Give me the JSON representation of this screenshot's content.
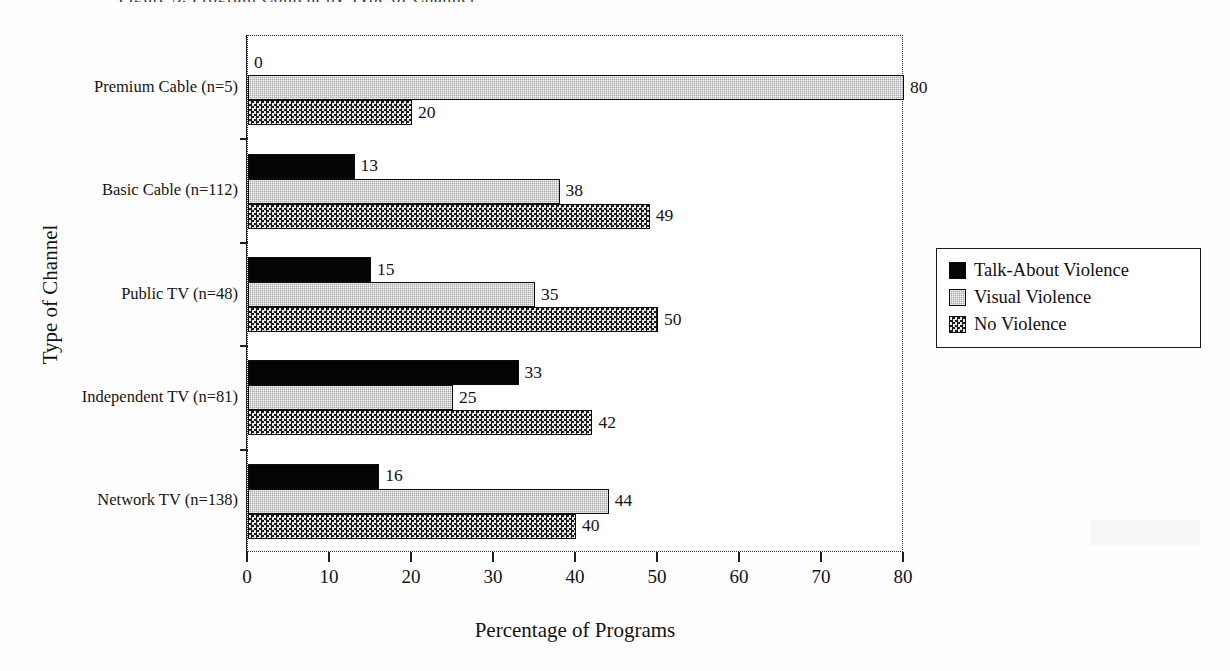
{
  "figure": {
    "title_fragment": "Figure 3. Program Content by Type of Channel",
    "y_axis_title": "Type of Channel",
    "x_axis_title": "Percentage of Programs"
  },
  "legend": {
    "items": [
      {
        "label": "Talk-About Violence",
        "swatch": "solid-black-swatch",
        "color": "#050505"
      },
      {
        "label": "Visual Violence",
        "swatch": "light-gray-dotted-swatch",
        "color": "#a8a8a8"
      },
      {
        "label": "No Violence",
        "swatch": "dark-checkered-swatch",
        "color": "#6d6d6d"
      }
    ]
  },
  "x_axis": {
    "ticks": [
      "0",
      "10",
      "20",
      "30",
      "40",
      "50",
      "60",
      "70",
      "80"
    ],
    "min": 0,
    "max": 80
  },
  "categories": [
    "Premium Cable (n=5)",
    "Basic Cable (n=112)",
    "Public TV (n=48)",
    "Independent TV (n=81)",
    "Network TV (n=138)"
  ],
  "chart_data": {
    "type": "bar",
    "orientation": "horizontal",
    "title": "Figure 3. Program Content by Type of Channel",
    "xlabel": "Percentage of Programs",
    "ylabel": "Type of Channel",
    "xlim": [
      0,
      80
    ],
    "xticks": [
      0,
      10,
      20,
      30,
      40,
      50,
      60,
      70,
      80
    ],
    "grid": false,
    "legend_position": "right",
    "categories": [
      "Premium Cable (n=5)",
      "Basic Cable (n=112)",
      "Public TV (n=48)",
      "Independent TV (n=81)",
      "Network TV (n=138)"
    ],
    "series": [
      {
        "name": "Talk-About Violence",
        "values": [
          0,
          13,
          15,
          33,
          16
        ],
        "labels": [
          "0",
          "13",
          "15",
          "33",
          "16"
        ]
      },
      {
        "name": "Visual Violence",
        "values": [
          80,
          38,
          35,
          25,
          44
        ],
        "labels": [
          "80",
          "38",
          "35",
          "25",
          "44"
        ]
      },
      {
        "name": "No Violence",
        "values": [
          20,
          49,
          50,
          42,
          40
        ],
        "labels": [
          "20",
          "49",
          "50",
          "42",
          "40"
        ]
      }
    ]
  }
}
